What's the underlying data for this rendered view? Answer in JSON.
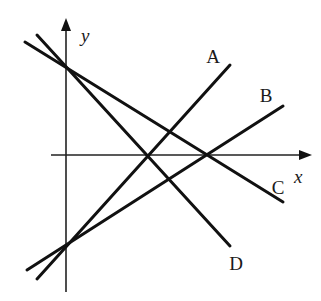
{
  "diagram": {
    "axes": {
      "x_label": "x",
      "y_label": "y",
      "origin": [
        66,
        155
      ],
      "x_axis": {
        "from": [
          51,
          155
        ],
        "to": [
          312,
          155
        ]
      },
      "y_axis": {
        "from": [
          66,
          292
        ],
        "to": [
          66,
          18
        ]
      }
    },
    "lines": [
      {
        "id": "A",
        "label": "A",
        "from": [
          37,
          279
        ],
        "to": [
          230,
          65
        ],
        "label_pos": [
          213,
          63
        ],
        "slope_sign": "positive",
        "y_intercept": "negative"
      },
      {
        "id": "B",
        "label": "B",
        "from": [
          27,
          270
        ],
        "to": [
          283,
          106
        ],
        "label_pos": [
          266,
          102
        ],
        "slope_sign": "positive",
        "y_intercept": "negative"
      },
      {
        "id": "C",
        "label": "C",
        "from": [
          25,
          42
        ],
        "to": [
          283,
          202
        ],
        "label_pos": [
          278,
          194
        ],
        "slope_sign": "negative",
        "y_intercept": "positive"
      },
      {
        "id": "D",
        "label": "D",
        "from": [
          37,
          35
        ],
        "to": [
          230,
          246
        ],
        "label_pos": [
          236,
          270
        ],
        "slope_sign": "negative",
        "y_intercept": "positive"
      }
    ],
    "intersections": [
      {
        "lines": [
          "C",
          "D"
        ],
        "point": [
          66,
          66
        ],
        "note": "on positive y-axis"
      },
      {
        "lines": [
          "A",
          "B"
        ],
        "point": [
          67,
          245
        ],
        "note": "on negative y-axis"
      },
      {
        "lines": [
          "B",
          "C"
        ],
        "point": [
          208,
          155
        ],
        "note": "on positive x-axis"
      },
      {
        "lines": [
          "D"
        ],
        "point": [
          148,
          155
        ],
        "note": "D crosses x-axis"
      }
    ]
  }
}
